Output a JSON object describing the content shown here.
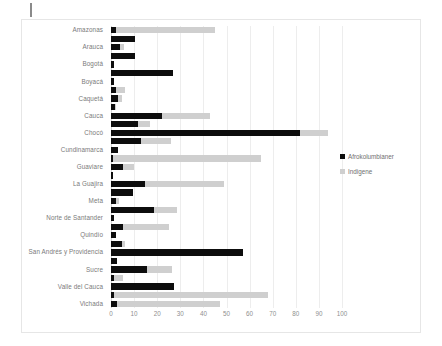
{
  "page": {
    "edge_mark": "page-edge-mark"
  },
  "legend": {
    "position": "right",
    "items": [
      {
        "label": "Afrokolumbianer",
        "color": "#0d0d0d"
      },
      {
        "label": "Indigene",
        "color": "#cfcfcf"
      }
    ]
  },
  "chart_data": {
    "type": "bar",
    "orientation": "horizontal",
    "title": "",
    "subtitle": "",
    "xlabel": "",
    "ylabel": "",
    "xlim": [
      0,
      100
    ],
    "ylim": null,
    "grid": true,
    "legend_position": "right",
    "xticks": [
      0,
      10,
      20,
      30,
      40,
      50,
      60,
      70,
      80,
      90,
      100
    ],
    "xticklabels": [
      "0",
      "10",
      "20",
      "30",
      "40",
      "50",
      "60",
      "70",
      "80",
      "90",
      "100"
    ],
    "categories": [
      "Amazonas",
      "Antioquia",
      "Arauca",
      "Atlántico",
      "Bogotá",
      "Bolívar",
      "Boyacá",
      "Caldas",
      "Caquetá",
      "Casanare",
      "Cauca",
      "Cesar",
      "Chocó",
      "Córdoba",
      "Cundinamarca",
      "Guainía",
      "Guaviare",
      "Huila",
      "La Guajira",
      "Magdalena",
      "Meta",
      "Nariño",
      "Norte de Santander",
      "Putumayo",
      "Quindío",
      "Risaralda",
      "San Andrés y Providencia",
      "Santander",
      "Sucre",
      "Tolima",
      "Valle del Cauca",
      "Vaupés",
      "Vichada"
    ],
    "visible_tick_labels": [
      "Amazonas",
      "Arauca",
      "Bogotá",
      "Boyacá",
      "Caquetá",
      "Cauca",
      "Chocó",
      "Cundinamarca",
      "Guaviare",
      "La Guajira",
      "Meta",
      "Norte de Santander",
      "Quindío",
      "San Andrés y Providencia",
      "Sucre",
      "Valle del Cauca",
      "Vichada"
    ],
    "series": [
      {
        "name": "Afrokolumbianer",
        "color": "#0d0d0d",
        "values": [
          2.0,
          10.4,
          3.8,
          10.6,
          1.4,
          27.0,
          1.4,
          2.0,
          3.2,
          1.6,
          22.2,
          11.8,
          82.0,
          13.2,
          3.0,
          1.0,
          5.4,
          1.0,
          14.6,
          9.6,
          2.0,
          18.6,
          1.2,
          5.0,
          2.0,
          4.6,
          57.0,
          2.6,
          15.8,
          1.4,
          27.2,
          1.2,
          2.6
        ]
      },
      {
        "name": "Indigene",
        "color": "#cfcfcf",
        "values": [
          45.0,
          0.0,
          5.6,
          0.0,
          0.0,
          0.0,
          0.0,
          6.2,
          4.6,
          2.2,
          43.0,
          17.0,
          94.0,
          26.0,
          0.0,
          65.0,
          9.8,
          0.0,
          49.0,
          0.0,
          3.6,
          28.6,
          0.0,
          25.0,
          0.0,
          6.0,
          0.0,
          0.0,
          26.4,
          5.0,
          0.0,
          68.0,
          47.0
        ]
      }
    ]
  }
}
